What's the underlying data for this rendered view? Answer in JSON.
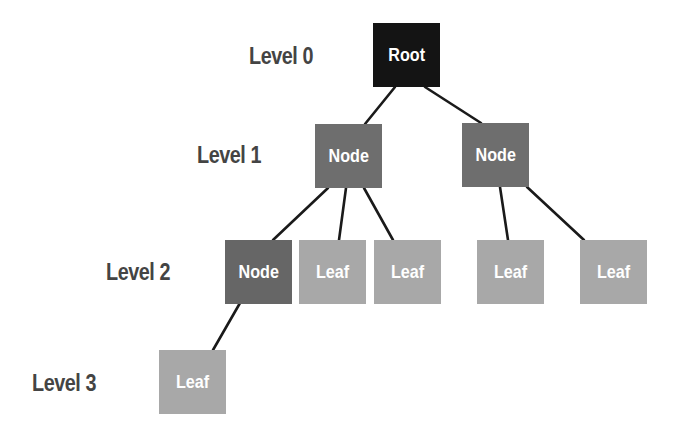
{
  "diagram": {
    "type": "tree",
    "levels": [
      {
        "label": "Level 0"
      },
      {
        "label": "Level 1"
      },
      {
        "label": "Level 2"
      },
      {
        "label": "Level 3"
      }
    ],
    "nodes": [
      {
        "id": "root",
        "label": "Root",
        "level": 0,
        "color": "#141414"
      },
      {
        "id": "n1a",
        "label": "Node",
        "level": 1,
        "color": "#6e6e6e"
      },
      {
        "id": "n1b",
        "label": "Node",
        "level": 1,
        "color": "#6e6e6e"
      },
      {
        "id": "n2a",
        "label": "Node",
        "level": 2,
        "color": "#666666"
      },
      {
        "id": "l2a",
        "label": "Leaf",
        "level": 2,
        "color": "#a8a8a8"
      },
      {
        "id": "l2b",
        "label": "Leaf",
        "level": 2,
        "color": "#a8a8a8"
      },
      {
        "id": "l2c",
        "label": "Leaf",
        "level": 2,
        "color": "#a8a8a8"
      },
      {
        "id": "l2d",
        "label": "Leaf",
        "level": 2,
        "color": "#a8a8a8"
      },
      {
        "id": "l3a",
        "label": "Leaf",
        "level": 3,
        "color": "#a8a8a8"
      }
    ],
    "edges": [
      [
        "root",
        "n1a"
      ],
      [
        "root",
        "n1b"
      ],
      [
        "n1a",
        "n2a"
      ],
      [
        "n1a",
        "l2a"
      ],
      [
        "n1a",
        "l2b"
      ],
      [
        "n1b",
        "l2c"
      ],
      [
        "n1b",
        "l2d"
      ],
      [
        "n2a",
        "l3a"
      ]
    ]
  }
}
